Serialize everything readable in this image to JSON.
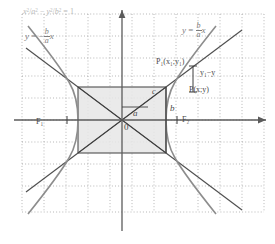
{
  "figure": {
    "kind": "hyperbola-geometry-diagram",
    "background": "#ffffff",
    "grid": {
      "color": "#9a9a9a",
      "style": "dotted",
      "spacing_px": 22,
      "left": 22,
      "top": 14,
      "right": 264,
      "bottom": 212
    },
    "axes": {
      "color": "#5b5b5b",
      "origin_label": "0",
      "x_axis_y": 120,
      "y_axis_x": 122,
      "x_arrow": "right",
      "y_arrow": "up"
    },
    "colors": {
      "curve": "#8d8d8d",
      "asymptote": "#4f4f4f",
      "rectangle_fill": "#e6e6e6",
      "rectangle_stroke": "#3f3f3f",
      "axis": "#5b5b5b",
      "grid": "#9a9a9a",
      "label_faint": "#b9b9b9",
      "label_mid": "#7d7d7d",
      "label_dark": "#4a4a4a"
    },
    "parameters": {
      "a_px": 44,
      "b_px": 33,
      "c_px": 55,
      "vertex_right_x": 166,
      "vertex_left_x": 78,
      "focus_right_x": 177,
      "focus_left_x": 67,
      "rect_top_y": 87,
      "rect_bottom_y": 153
    }
  },
  "labels": {
    "equation": {
      "text": "x²/a² − y²/b² = 1",
      "x_num": "x",
      "x_sup": "2",
      "a_den": "a",
      "a_sup": "2",
      "y_num": "y",
      "y_sup": "2",
      "b_den": "b",
      "b_sup": "2",
      "rhs": "1",
      "minus": "−",
      "equals": "=",
      "slash": "/"
    },
    "asymptote_left": {
      "lhs": "y",
      "equals": "=",
      "sign": "−",
      "num": "b",
      "den": "a",
      "var": "x"
    },
    "asymptote_right": {
      "lhs": "y",
      "equals": "=",
      "num": "b",
      "den": "a",
      "var": "x"
    },
    "point_p1": "P₁(x₁;y₁)",
    "point_p": "P(x;y)",
    "segment_diff": "y₁−y",
    "focus_left": "F₁",
    "focus_right": "F₂",
    "side_a": "a",
    "side_b": "b",
    "side_c": "c",
    "origin": "0"
  },
  "caption": {
    "text": ""
  }
}
